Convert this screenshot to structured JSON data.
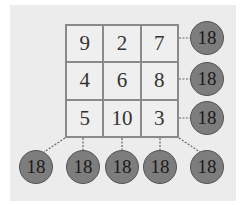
{
  "grid": {
    "rows": [
      [
        "9",
        "2",
        "7"
      ],
      [
        "4",
        "6",
        "8"
      ],
      [
        "5",
        "10",
        "3"
      ]
    ]
  },
  "sums": {
    "rows": [
      "18",
      "18",
      "18"
    ],
    "anti_diagonal": "18",
    "columns": [
      "18",
      "18",
      "18"
    ],
    "main_diagonal": "18"
  },
  "colors": {
    "circle_fill": "#7d7d7d",
    "grid_line": "#8a8a8a",
    "background": "#ececec"
  }
}
